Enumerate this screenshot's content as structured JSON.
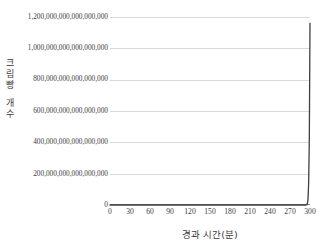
{
  "chart_data": {
    "type": "line",
    "title": "",
    "xlabel": "경과 시간(분)",
    "ylabel": "크림빵 개수",
    "ylabel_chars": [
      "크",
      "림",
      "빵",
      "개",
      "수"
    ],
    "xlim": [
      0,
      300
    ],
    "ylim": [
      0,
      1200000000000000000
    ],
    "grid": true,
    "legend": "none",
    "xticks": [
      0,
      30,
      60,
      90,
      120,
      150,
      180,
      210,
      240,
      270,
      300
    ],
    "xtick_labels": [
      "0",
      "30",
      "60",
      "90",
      "120",
      "150",
      "180",
      "210",
      "240",
      "270",
      "300"
    ],
    "yticks": [
      0,
      200000000000000000,
      400000000000000000,
      600000000000000000,
      800000000000000000,
      1000000000000000000,
      1200000000000000000
    ],
    "ytick_labels": [
      "0",
      "200,000,000,000,000,000",
      "400,000,000,000,000,000",
      "600,000,000,000,000,000",
      "800,000,000,000,000,000",
      "1,000,000,000,000,000,000",
      "1,200,000,000,000,000,000"
    ],
    "series": [
      {
        "name": "크림빵 개수",
        "color": "#404040",
        "x": [
          0,
          15,
          30,
          45,
          60,
          75,
          90,
          105,
          120,
          135,
          150,
          165,
          180,
          195,
          210,
          225,
          240,
          250,
          255,
          260,
          265,
          270,
          273,
          276,
          279,
          282,
          285,
          288,
          290,
          292,
          294,
          295,
          296,
          297,
          298,
          299,
          300
        ],
        "y": [
          1,
          2,
          4,
          8,
          16,
          32,
          64,
          128,
          256,
          512,
          1024,
          2048,
          4096,
          8192,
          16384,
          32768,
          65536,
          131072,
          262144,
          524288,
          1048576,
          2097152,
          8388608,
          33554432,
          134217728,
          1073741824,
          17179869184,
          274877906944,
          2199023255552,
          17592186044416,
          140737488355328,
          1125899906842624,
          9007199254740992,
          36028797018963968,
          144115188075855870,
          432345564227567600,
          1160000000000000000
        ]
      }
    ],
    "curve_path": "M 0,188 L 160,187.6 L 166,187.2 L 170,186.6 L 173,185.6 L 176,184 L 178,182 L 180,179 L 181.5,176 L 183,172 L 184.5,166 L 186,157 L 187.3,146 L 188.5,132 L 189.6,115 L 190.6,96 L 191.5,76 L 192.3,56 L 193,36 L 193.6,19 L 194,8 L 194.3,4 L 194.5,4"
  },
  "colors": {
    "background": "#ffffff",
    "gridline": "#d9d9d9",
    "axis": "#7f7f7f",
    "curve": "#404040",
    "text": "#3c3c3c"
  }
}
